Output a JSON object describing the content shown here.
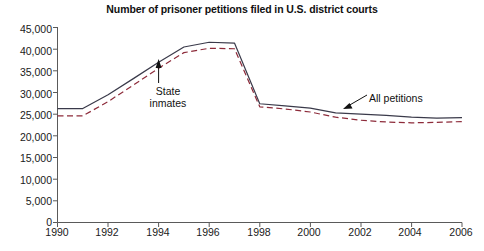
{
  "chart_data": {
    "type": "line",
    "title": "Number of prisoner petitions filed in U.S. district courts",
    "xlabel": "",
    "ylabel": "",
    "xlim": [
      1990,
      2006
    ],
    "ylim": [
      0,
      45000
    ],
    "grid": false,
    "legend_position": "inline-annotations",
    "x": [
      1990,
      1991,
      1992,
      1993,
      1994,
      1995,
      1996,
      1997,
      1998,
      1999,
      2000,
      2001,
      2002,
      2003,
      2004,
      2005,
      2006
    ],
    "xtick_labels": [
      "1990",
      "1992",
      "1994",
      "1996",
      "1998",
      "2000",
      "2002",
      "2004",
      "2006"
    ],
    "xticks": [
      1990,
      1992,
      1994,
      1996,
      1998,
      2000,
      2002,
      2004,
      2006
    ],
    "yticks": [
      0,
      5000,
      10000,
      15000,
      20000,
      25000,
      30000,
      35000,
      40000,
      45000
    ],
    "ytick_labels": [
      "0",
      "5,000",
      "10,000",
      "15,000",
      "20,000",
      "25,000",
      "30,000",
      "35,000",
      "40,000",
      "45,000"
    ],
    "series": [
      {
        "name": "All petitions",
        "style": "solid",
        "color": "#3a3a4a",
        "values": [
          26300,
          26300,
          29500,
          33200,
          37000,
          40500,
          41600,
          41400,
          27400,
          26900,
          26400,
          25300,
          25000,
          24700,
          24300,
          24100,
          24200
        ]
      },
      {
        "name": "State inmates",
        "style": "dashed",
        "color": "#8d2b3a",
        "values": [
          24600,
          24600,
          27900,
          31700,
          35600,
          39200,
          40200,
          40100,
          26700,
          26200,
          25500,
          24300,
          23600,
          23200,
          23000,
          23100,
          23300
        ]
      }
    ],
    "annotations": [
      {
        "id": "state-inmates",
        "text_lines": [
          "State",
          "inmates"
        ],
        "points_to_series": "State inmates",
        "points_to_x": 1994,
        "arrow_direction": "up"
      },
      {
        "id": "all-petitions",
        "text_lines": [
          "All petitions"
        ],
        "points_to_series": "All petitions",
        "points_to_x": 2001,
        "arrow_direction": "down-left"
      }
    ]
  },
  "axis": {
    "y_labels": [
      "45,000",
      "40,000",
      "35,000",
      "30,000",
      "25,000",
      "20,000",
      "15,000",
      "10,000",
      "5,000",
      "0"
    ],
    "x_labels": [
      "1990",
      "1992",
      "1994",
      "1996",
      "1998",
      "2000",
      "2002",
      "2004",
      "2006"
    ]
  },
  "annotations": {
    "state_line1": "State",
    "state_line2": "inmates",
    "all_petitions": "All petitions"
  },
  "colors": {
    "all_petitions_line": "#3a3a4a",
    "state_inmates_line": "#8d2b3a",
    "axis": "#5a5a5a",
    "text": "#111111",
    "background": "#ffffff"
  }
}
